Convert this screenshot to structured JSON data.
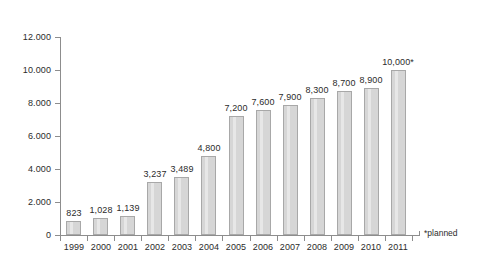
{
  "chart_data": {
    "type": "bar",
    "title": "",
    "xlabel": "",
    "ylabel": "",
    "categories": [
      "1999",
      "2000",
      "2001",
      "2002",
      "2003",
      "2004",
      "2005",
      "2006",
      "2007",
      "2008",
      "2009",
      "2010",
      "2011"
    ],
    "values": [
      823,
      1028,
      1139,
      3237,
      3489,
      4800,
      7200,
      7600,
      7900,
      8300,
      8700,
      8900,
      10000
    ],
    "value_labels": [
      "823",
      "1,028",
      "1,139",
      "3,237",
      "3,489",
      "4,800",
      "7,200",
      "7,600",
      "7,900",
      "8,300",
      "8,700",
      "8,900",
      "10,000*"
    ],
    "ylim": [
      0,
      12000
    ],
    "y_tick_values": [
      0,
      2000,
      4000,
      6000,
      8000,
      10000,
      12000
    ],
    "y_tick_labels": [
      "0",
      "2.000",
      "4.000",
      "6.000",
      "8.000",
      "10.000",
      "12.000"
    ],
    "grid": false,
    "legend": null,
    "annotations": [
      "*planned"
    ],
    "series_color": "#d6d6d6",
    "series_border_color": "#a8a8a8",
    "axis_color": "#8d8d8d",
    "background_color": "#ffffff",
    "text_color": "#2b2b2b"
  },
  "footnote": {
    "text": "*planned"
  }
}
